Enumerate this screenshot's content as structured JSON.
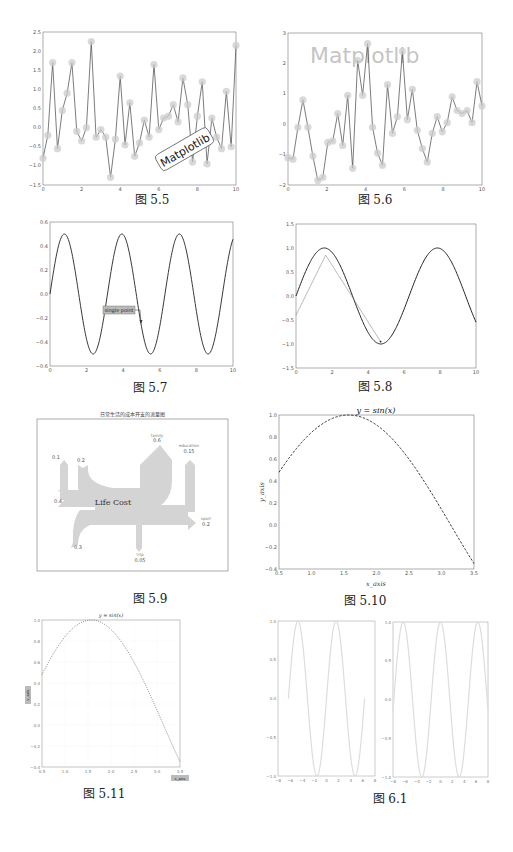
{
  "page": {
    "captions": {
      "fig_5_5": "图 5.5",
      "fig_5_6": "图 5.6",
      "fig_5_7": "图 5.7",
      "fig_5_8": "图 5.8",
      "fig_5_9": "图 5.9",
      "fig_5_10": "图 5.10",
      "fig_5_11": "图 5.11",
      "fig_6_1": "图 6.1"
    }
  },
  "figures": {
    "fig_5_5": {
      "annotation": "Matplotlib",
      "xticks": [
        "0",
        "2",
        "4",
        "6",
        "8",
        "10"
      ],
      "yticks": [
        "2.5",
        "2.0",
        "1.5",
        "1.0",
        "0.5",
        "0.0",
        "−0.5",
        "−1.0",
        "−1.5"
      ]
    },
    "fig_5_6": {
      "watermark": "Matplotlib",
      "xticks": [
        "0",
        "2",
        "4",
        "6",
        "8",
        "10"
      ],
      "yticks": [
        "3",
        "2",
        "1",
        "0",
        "−1",
        "−2"
      ]
    },
    "fig_5_7": {
      "annotation": "single point",
      "xticks": [
        "0",
        "2",
        "4",
        "6",
        "8",
        "10"
      ],
      "yticks": [
        "0.6",
        "0.4",
        "0.2",
        "0.0",
        "−0.2",
        "−0.4",
        "−0.6"
      ]
    },
    "fig_5_8": {
      "xticks": [
        "0",
        "2",
        "4",
        "6",
        "8",
        "10"
      ],
      "yticks": [
        "1.5",
        "1.0",
        "0.5",
        "0.0",
        "−0.5",
        "−1.0",
        "−1.5"
      ]
    },
    "fig_5_9": {
      "title": "日常生活的成本开支的流量图",
      "center_label": "Life Cost",
      "flows": [
        {
          "label": "family",
          "value": "0.6"
        },
        {
          "label": "education",
          "value": "0.15"
        },
        {
          "label": "sport",
          "value": "0.2"
        },
        {
          "label": "trip",
          "value": "0.05"
        },
        {
          "label": "",
          "value": "0.1"
        },
        {
          "label": "",
          "value": "0.2"
        },
        {
          "label": "",
          "value": "0.4"
        },
        {
          "label": "",
          "value": "0.3"
        }
      ]
    },
    "fig_5_10": {
      "title": "y = sin(x)",
      "xlabel": "x_axis",
      "ylabel": "y_axis",
      "xticks": [
        "0.5",
        "1.0",
        "1.5",
        "2.0",
        "2.5",
        "3.0",
        "3.5"
      ],
      "yticks": [
        "1.0",
        "0.8",
        "0.6",
        "0.4",
        "0.2",
        "0.0",
        "−0.2",
        "−0.4"
      ]
    },
    "fig_5_11": {
      "title": "y = sin(x)",
      "xlabel": "x_axis",
      "ylabel": "y_axis",
      "xticks": [
        "0.5",
        "1.0",
        "1.5",
        "2.0",
        "2.5",
        "3.0",
        "3.5"
      ],
      "yticks": [
        "1.0",
        "0.8",
        "0.6",
        "0.4",
        "0.2",
        "0.0",
        "−0.2",
        "−0.4"
      ]
    },
    "fig_6_1": {
      "left": {
        "xticks": [
          "−8",
          "−6",
          "−4",
          "−2",
          "0",
          "2",
          "4",
          "6",
          "8"
        ],
        "yticks": [
          "1.0",
          "0.5",
          "0.0",
          "−0.5",
          "−1.0"
        ]
      },
      "right": {
        "xticks": [
          "−8",
          "−6",
          "−4",
          "−2",
          "0",
          "2",
          "4",
          "6",
          "8"
        ],
        "yticks": [
          "1.0",
          "0.5",
          "0.0",
          "−0.5",
          "−1.0"
        ]
      }
    }
  },
  "chart_data": [
    {
      "id": "fig_5_5",
      "type": "line",
      "title": "",
      "xlabel": "",
      "ylabel": "",
      "xlim": [
        0,
        10
      ],
      "ylim": [
        -1.5,
        2.5
      ],
      "marker": "circle",
      "annotations": [
        "Matplotlib"
      ],
      "x": [
        0,
        0.2,
        0.4,
        0.6,
        0.8,
        1.0,
        1.2,
        1.4,
        1.6,
        1.8,
        2.0,
        2.2,
        2.4,
        2.6,
        2.8,
        3.0,
        3.2,
        3.4,
        3.6,
        3.8,
        4.0,
        4.2,
        4.4,
        4.6,
        4.8,
        5.0,
        5.2,
        5.4,
        5.6,
        5.8,
        6.0,
        6.2,
        6.4,
        6.6,
        6.8,
        7.0,
        7.2,
        7.4,
        7.6,
        7.8,
        8.0,
        8.2,
        8.4,
        8.6,
        8.8,
        9.0,
        9.2,
        9.4,
        9.6,
        9.8,
        10.0
      ],
      "values": [
        -0.8,
        -0.2,
        1.7,
        -0.55,
        0.45,
        0.9,
        1.7,
        -0.1,
        -0.35,
        0.0,
        2.25,
        -0.25,
        -0.05,
        -0.25,
        -1.3,
        -0.3,
        1.35,
        -0.45,
        0.65,
        -0.75,
        -0.4,
        0.2,
        -0.25,
        1.65,
        -0.05,
        0.25,
        0.3,
        0.6,
        0.15,
        1.3,
        0.6,
        -0.9,
        0.3,
        1.2,
        -0.95,
        0.25,
        -0.25,
        -0.55,
        0.95,
        -0.5,
        2.15
      ]
    },
    {
      "id": "fig_5_6",
      "type": "line",
      "xlim": [
        0,
        10
      ],
      "ylim": [
        -2,
        3
      ],
      "marker": "circle",
      "annotations": [
        "Matplotlib"
      ],
      "values": [
        -1.1,
        -1.15,
        -0.1,
        0.8,
        -0.1,
        -1.05,
        -1.85,
        -1.75,
        -0.6,
        -0.55,
        0.35,
        -0.7,
        0.95,
        -1.45,
        2.1,
        0.95,
        2.65,
        -0.1,
        -0.95,
        -1.35,
        1.3,
        -0.3,
        0.25,
        2.4,
        0.15,
        1.15,
        -0.2,
        -0.8,
        -1.25,
        -0.3,
        0.25,
        -0.25,
        0.05,
        0.9,
        0.45,
        0.35,
        0.45,
        0.05,
        1.4,
        0.6
      ]
    },
    {
      "id": "fig_5_7",
      "type": "line",
      "xlim": [
        0,
        10
      ],
      "ylim": [
        -0.6,
        0.6
      ],
      "function": "0.5*sin(2x)",
      "annotations": [
        {
          "text": "single point",
          "xy": [
            5,
            -0.25
          ]
        }
      ]
    },
    {
      "id": "fig_5_8",
      "type": "line",
      "xlim": [
        0,
        10
      ],
      "ylim": [
        -1.5,
        1.5
      ],
      "function": "sin(x)",
      "annotations": [
        {
          "type": "arrow",
          "from": [
            0,
            -0.4
          ],
          "via": [
            1.65,
            0.85
          ],
          "to": [
            4.7,
            -0.95
          ]
        }
      ]
    },
    {
      "id": "fig_5_9",
      "type": "sankey",
      "title": "日常生活的成本开支的流量图",
      "center": "Life Cost",
      "inputs": [
        0.1,
        0.2,
        0.4,
        0.3
      ],
      "outputs": [
        {
          "family": 0.6
        },
        {
          "education": 0.15
        },
        {
          "sport": 0.2
        },
        {
          "trip": 0.05
        }
      ]
    },
    {
      "id": "fig_5_10",
      "type": "line",
      "title": "y = sin(x)",
      "xlabel": "x_axis",
      "ylabel": "y_axis",
      "xlim": [
        0.5,
        3.5
      ],
      "ylim": [
        -0.4,
        1.0
      ],
      "linestyle": "dashed",
      "function": "sin(x)"
    },
    {
      "id": "fig_5_11",
      "type": "line",
      "title": "y = sin(x)",
      "xlabel": "x_axis",
      "ylabel": "y_axis",
      "xlim": [
        0.5,
        3.5
      ],
      "ylim": [
        -0.4,
        1.0
      ],
      "linestyle": "dotted",
      "grid": true,
      "function": "sin(x)"
    },
    {
      "id": "fig_6_1",
      "type": "line",
      "subplots": 2,
      "left": {
        "xlim": [
          -8,
          8
        ],
        "ylim": [
          -1,
          1
        ],
        "function": "sin(x)",
        "x_range": [
          -2.0,
          2.0
        ],
        "note": "sin over ~[-2π, 2π], starts at 0"
      },
      "right": {
        "xlim": [
          -8,
          8
        ],
        "ylim": [
          -1,
          1
        ],
        "function": "cos(x)"
      }
    }
  ]
}
